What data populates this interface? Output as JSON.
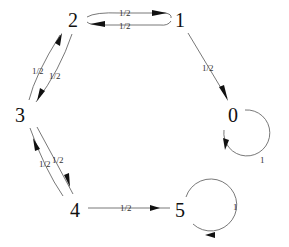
{
  "diagram": {
    "type": "markov-chain-state-diagram",
    "nodes": [
      {
        "id": "0",
        "label": "0"
      },
      {
        "id": "1",
        "label": "1"
      },
      {
        "id": "2",
        "label": "2"
      },
      {
        "id": "3",
        "label": "3"
      },
      {
        "id": "4",
        "label": "4"
      },
      {
        "id": "5",
        "label": "5"
      }
    ],
    "edges": [
      {
        "from": "2",
        "to": "1",
        "label": "1/2"
      },
      {
        "from": "1",
        "to": "2",
        "label": "1/2"
      },
      {
        "from": "1",
        "to": "0",
        "label": "1/2"
      },
      {
        "from": "0",
        "to": "0",
        "label": "1"
      },
      {
        "from": "3",
        "to": "2",
        "label": "1/2"
      },
      {
        "from": "2",
        "to": "3",
        "label": "1/2"
      },
      {
        "from": "4",
        "to": "3",
        "label": "1/2"
      },
      {
        "from": "3",
        "to": "4",
        "label": "1/2"
      },
      {
        "from": "4",
        "to": "5",
        "label": "1/2"
      },
      {
        "from": "5",
        "to": "5",
        "label": "1"
      }
    ]
  }
}
